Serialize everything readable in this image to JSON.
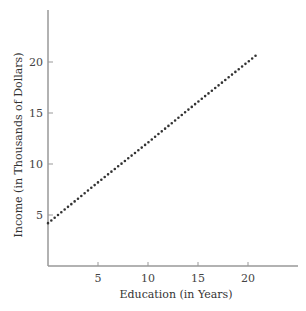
{
  "chart_data": {
    "type": "line",
    "title": "",
    "xlabel": "Education (in Years)",
    "ylabel": "Income (in Thousands of Dollars)",
    "xlim": [
      0,
      25
    ],
    "ylim": [
      0,
      25
    ],
    "x_ticks": [
      5,
      10,
      15,
      20
    ],
    "y_ticks": [
      5,
      10,
      15,
      20
    ],
    "grid": false,
    "legend": null,
    "series": [
      {
        "name": "Income vs Education",
        "style": "dotted",
        "color": "#333333",
        "x": [
          0,
          5,
          10,
          15,
          21
        ],
        "y": [
          4.2,
          8.2,
          12.1,
          16.1,
          20.8
        ]
      }
    ]
  },
  "colors": {
    "axis": "#999999",
    "line": "#333333"
  }
}
